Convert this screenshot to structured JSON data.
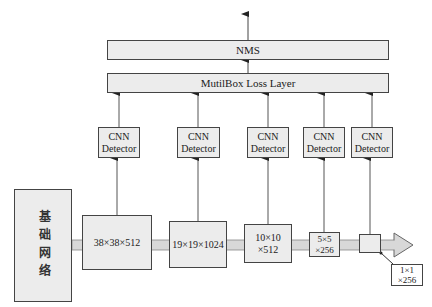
{
  "top_layers": {
    "nms": "NMS",
    "loss": "MutilBox Loss Layer"
  },
  "detectors": [
    {
      "label": "CNN\nDetector",
      "x": 98
    },
    {
      "label": "CNN\nDetector",
      "x": 177
    },
    {
      "label": "CNN\nDetector",
      "x": 247
    },
    {
      "label": "CNN\nDetector",
      "x": 303
    },
    {
      "label": "CNN\nDetector",
      "x": 351
    }
  ],
  "base_network": "基础网络",
  "feature_maps": [
    {
      "label": "38×38×512"
    },
    {
      "label": "19×19×1024"
    },
    {
      "label": "10×10\n×512"
    },
    {
      "label": "5×5\n×256"
    },
    {
      "label": ""
    }
  ],
  "callout": "1×1\n×256",
  "colors": {
    "box_fill": "#ececec",
    "border": "#444444",
    "band": "#d8d8d8"
  }
}
